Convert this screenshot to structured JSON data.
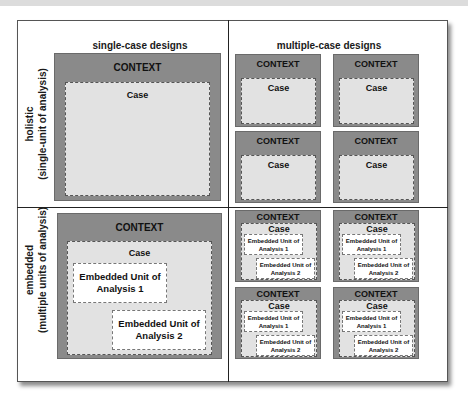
{
  "columns": {
    "single": "single-case designs",
    "multiple": "multiple-case designs"
  },
  "rows": {
    "holistic": {
      "line1": "holistic",
      "line2": "(single-unit of analysis)"
    },
    "embedded": {
      "line1": "embedded",
      "line2": "(multiple units of analysis)"
    }
  },
  "labels": {
    "context": "CONTEXT",
    "case": "Case",
    "unit1_line1": "Embedded Unit of",
    "unit1_line2": "Analysis 1",
    "unit2_line1": "Embedded Unit of",
    "unit2_line2": "Analysis 2"
  },
  "colors": {
    "context_fill": "#8a8a8a",
    "case_fill": "#e2e2e2",
    "unit_fill": "#ffffff"
  }
}
